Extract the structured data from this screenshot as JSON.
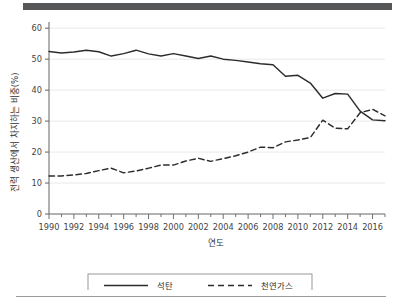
{
  "chart_data": {
    "type": "line",
    "title": "",
    "xlabel": "연도",
    "ylabel": "전력 생산에서 차지하는 비중(%)",
    "xlim": [
      1990,
      2017
    ],
    "ylim": [
      0,
      62
    ],
    "yticks": [
      0,
      10,
      20,
      30,
      40,
      50,
      60
    ],
    "xticks": [
      1990,
      1992,
      1994,
      1996,
      1998,
      2000,
      2002,
      2004,
      2006,
      2008,
      2010,
      2012,
      2014,
      2016
    ],
    "xtick_labels": [
      "1990",
      "1992",
      "1994",
      "1996",
      "1998",
      "2000",
      "2002",
      "2004",
      "2006",
      "2008",
      "2010",
      "2012",
      "2014",
      "2016"
    ],
    "ytick_labels": [
      "0",
      "10",
      "20",
      "30",
      "40",
      "50",
      "60"
    ],
    "grid": "horizontal",
    "legend_position": "bottom",
    "x": [
      1990,
      1991,
      1992,
      1993,
      1994,
      1995,
      1996,
      1997,
      1998,
      1999,
      2000,
      2001,
      2002,
      2003,
      2004,
      2005,
      2006,
      2007,
      2008,
      2009,
      2010,
      2011,
      2012,
      2013,
      2014,
      2015,
      2016,
      2017
    ],
    "series": [
      {
        "name": "석탄",
        "style": "solid",
        "color": "#2b2c2d",
        "values": [
          52.5,
          52.0,
          52.3,
          52.9,
          52.4,
          51.0,
          51.8,
          52.9,
          51.7,
          51.0,
          51.8,
          51.0,
          50.2,
          51.0,
          50.0,
          49.6,
          49.1,
          48.5,
          48.2,
          44.5,
          44.8,
          42.3,
          37.4,
          38.9,
          38.7,
          33.2,
          30.4,
          30.1
        ]
      },
      {
        "name": "천연가스",
        "style": "dashed",
        "color": "#2b2c2d",
        "values": [
          12.3,
          12.3,
          12.6,
          13.1,
          14.0,
          14.8,
          13.3,
          13.9,
          14.8,
          15.8,
          15.8,
          17.1,
          18.0,
          17.0,
          17.9,
          18.8,
          20.0,
          21.6,
          21.4,
          23.3,
          23.9,
          24.7,
          30.3,
          27.7,
          27.5,
          32.7,
          33.8,
          31.7
        ]
      }
    ]
  },
  "legend": {
    "items": [
      {
        "label": "석탄",
        "style": "solid"
      },
      {
        "label": "천연가스",
        "style": "dashed"
      }
    ]
  }
}
